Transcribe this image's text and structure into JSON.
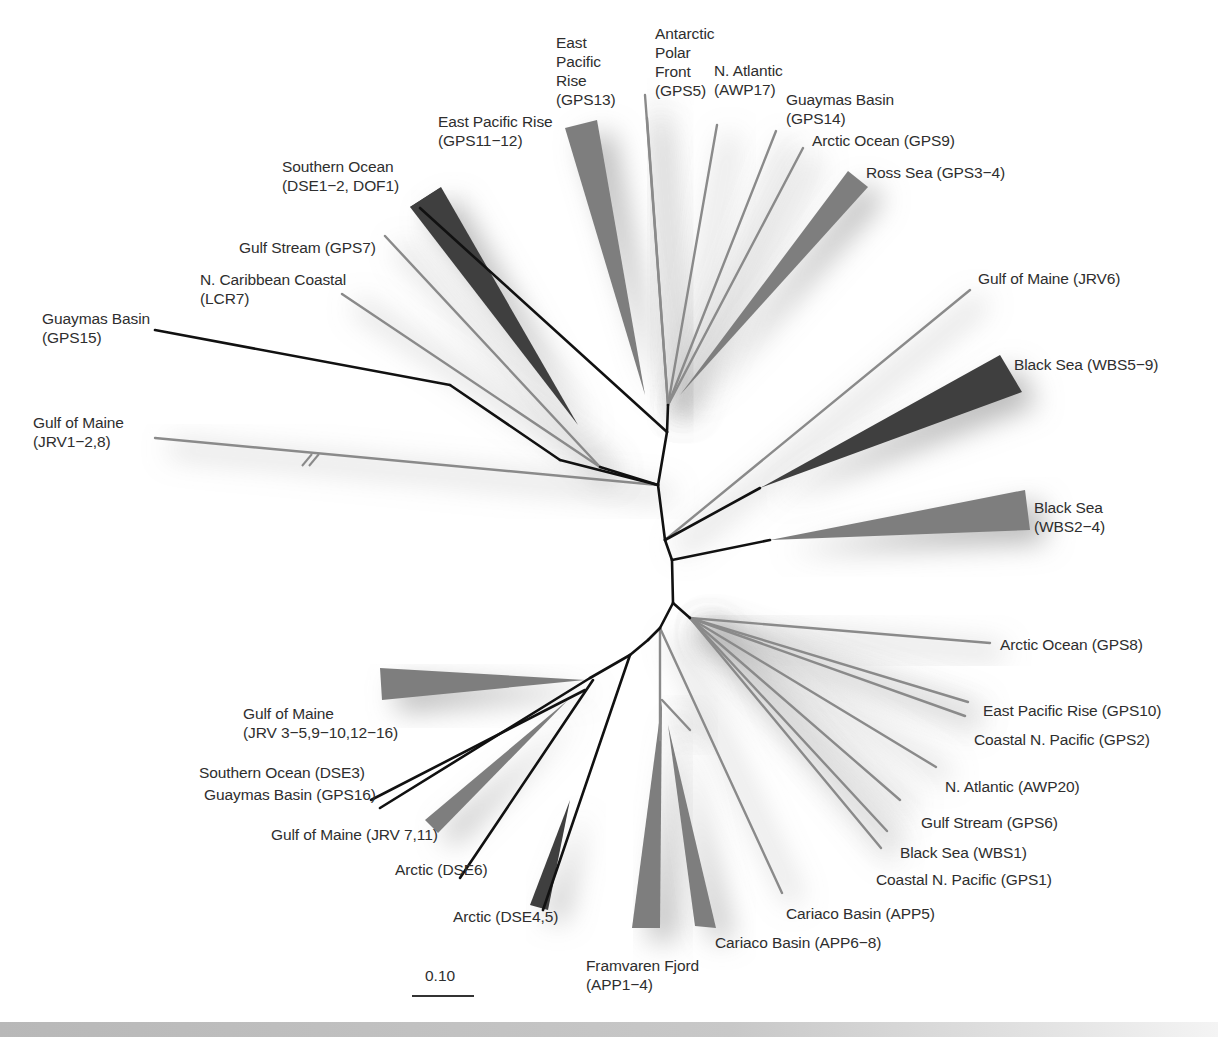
{
  "figure": {
    "type": "unrooted phylogenetic tree",
    "scale_bar": {
      "label": "0.10",
      "length_px": 62
    }
  },
  "colors": {
    "backbone": "#111111",
    "leaf_branch": "#8a8a8a",
    "clade_light": "#7e7e7e",
    "clade_dark": "#3f3f3f",
    "label_text": "#2e2e2e",
    "shadow": "#9a9a9a"
  },
  "labels": [
    {
      "id": "l1",
      "text": "East\nPacific\nRise\n(GPS13)",
      "x": 556,
      "y": 33
    },
    {
      "id": "l2",
      "text": "Antarctic\nPolar\nFront\n(GPS5)",
      "x": 655,
      "y": 24
    },
    {
      "id": "l3",
      "text": "N. Atlantic\n(AWP17)",
      "x": 714,
      "y": 61
    },
    {
      "id": "l4",
      "text": "Guaymas Basin\n(GPS14)",
      "x": 786,
      "y": 90
    },
    {
      "id": "l5",
      "text": "Arctic Ocean (GPS9)",
      "x": 812,
      "y": 131
    },
    {
      "id": "l6",
      "text": "East Pacific Rise\n(GPS11−12)",
      "x": 438,
      "y": 112
    },
    {
      "id": "l7",
      "text": "Ross Sea (GPS3−4)",
      "x": 866,
      "y": 163
    },
    {
      "id": "l8",
      "text": "Southern Ocean\n(DSE1−2, DOF1)",
      "x": 282,
      "y": 157
    },
    {
      "id": "l9",
      "text": "Gulf Stream (GPS7)",
      "x": 239,
      "y": 238
    },
    {
      "id": "l10",
      "text": "N. Caribbean Coastal\n(LCR7)",
      "x": 200,
      "y": 270
    },
    {
      "id": "l11",
      "text": "Gulf of Maine (JRV6)",
      "x": 978,
      "y": 269
    },
    {
      "id": "l12",
      "text": "Guaymas Basin\n(GPS15)",
      "x": 42,
      "y": 309
    },
    {
      "id": "l13",
      "text": "Black Sea (WBS5−9)",
      "x": 1014,
      "y": 355
    },
    {
      "id": "l14",
      "text": "Gulf of Maine\n(JRV1−2,8)",
      "x": 33,
      "y": 413
    },
    {
      "id": "l15",
      "text": "Black Sea\n(WBS2−4)",
      "x": 1034,
      "y": 498
    },
    {
      "id": "l16",
      "text": "Arctic Ocean (GPS8)",
      "x": 1000,
      "y": 635
    },
    {
      "id": "l17",
      "text": "East Pacific Rise (GPS10)",
      "x": 983,
      "y": 701
    },
    {
      "id": "l18",
      "text": "Coastal N. Pacific (GPS2)",
      "x": 974,
      "y": 730
    },
    {
      "id": "l19",
      "text": "Gulf of Maine\n(JRV 3−5,9−10,12−16)",
      "x": 243,
      "y": 704
    },
    {
      "id": "l20",
      "text": "Southern Ocean (DSE3)",
      "x": 199,
      "y": 763
    },
    {
      "id": "l21",
      "text": "Guaymas Basin (GPS16)",
      "x": 204,
      "y": 785
    },
    {
      "id": "l22",
      "text": "N. Atlantic (AWP20)",
      "x": 945,
      "y": 777
    },
    {
      "id": "l23",
      "text": "Gulf of Maine (JRV 7,11)",
      "x": 271,
      "y": 825
    },
    {
      "id": "l24",
      "text": "Gulf Stream (GPS6)",
      "x": 921,
      "y": 813
    },
    {
      "id": "l25",
      "text": "Black Sea (WBS1)",
      "x": 900,
      "y": 843
    },
    {
      "id": "l26",
      "text": "Arctic (DSE6)",
      "x": 395,
      "y": 860
    },
    {
      "id": "l27",
      "text": "Coastal N. Pacific (GPS1)",
      "x": 876,
      "y": 870
    },
    {
      "id": "l28",
      "text": "Arctic (DSE4,5)",
      "x": 453,
      "y": 907
    },
    {
      "id": "l29",
      "text": "Cariaco Basin (APP5)",
      "x": 786,
      "y": 904
    },
    {
      "id": "l30",
      "text": "Cariaco Basin (APP6−8)",
      "x": 715,
      "y": 933
    },
    {
      "id": "l31",
      "text": "Framvaren Fjord\n(APP1−4)",
      "x": 586,
      "y": 956
    }
  ],
  "backbone": [
    [
      [
        658,
        485
      ],
      [
        667,
        432
      ]
    ],
    [
      [
        667,
        432
      ],
      [
        668,
        405
      ]
    ],
    [
      [
        658,
        485
      ],
      [
        665,
        540
      ]
    ],
    [
      [
        665,
        540
      ],
      [
        672,
        560
      ]
    ],
    [
      [
        672,
        560
      ],
      [
        673,
        603
      ]
    ],
    [
      [
        673,
        603
      ],
      [
        660,
        628
      ]
    ],
    [
      [
        673,
        603
      ],
      [
        690,
        618
      ]
    ],
    [
      [
        660,
        628
      ],
      [
        648,
        640
      ]
    ],
    [
      [
        648,
        640
      ],
      [
        630,
        655
      ]
    ],
    [
      [
        630,
        655
      ],
      [
        590,
        678
      ]
    ],
    [
      [
        658,
        485
      ],
      [
        560,
        460
      ]
    ],
    [
      [
        560,
        460
      ],
      [
        450,
        385
      ]
    ],
    [
      [
        450,
        385
      ],
      [
        155,
        330
      ]
    ],
    [
      [
        658,
        485
      ],
      [
        600,
        467
      ]
    ],
    [
      [
        667,
        432
      ],
      [
        420,
        208
      ]
    ],
    [
      [
        665,
        540
      ],
      [
        760,
        488
      ]
    ],
    [
      [
        672,
        560
      ],
      [
        770,
        540
      ]
    ],
    [
      [
        630,
        655
      ],
      [
        543,
        910
      ]
    ],
    [
      [
        590,
        678
      ],
      [
        380,
        808
      ]
    ],
    [
      [
        585,
        690
      ],
      [
        371,
        800
      ]
    ],
    [
      [
        593,
        680
      ],
      [
        460,
        878
      ]
    ]
  ],
  "leaf_branches": [
    [
      [
        668,
        405
      ],
      [
        645,
        95
      ]
    ],
    [
      [
        668,
        405
      ],
      [
        647,
        118
      ]
    ],
    [
      [
        668,
        405
      ],
      [
        717,
        125
      ]
    ],
    [
      [
        668,
        405
      ],
      [
        776,
        131
      ]
    ],
    [
      [
        668,
        405
      ],
      [
        803,
        148
      ]
    ],
    [
      [
        600,
        467
      ],
      [
        385,
        236
      ]
    ],
    [
      [
        600,
        467
      ],
      [
        342,
        294
      ]
    ],
    [
      [
        658,
        485
      ],
      [
        155,
        438
      ]
    ],
    [
      [
        665,
        540
      ],
      [
        970,
        290
      ]
    ],
    [
      [
        690,
        618
      ],
      [
        990,
        643
      ]
    ],
    [
      [
        690,
        618
      ],
      [
        968,
        702
      ]
    ],
    [
      [
        690,
        618
      ],
      [
        965,
        716
      ]
    ],
    [
      [
        690,
        618
      ],
      [
        936,
        767
      ]
    ],
    [
      [
        690,
        618
      ],
      [
        900,
        800
      ]
    ],
    [
      [
        690,
        618
      ],
      [
        887,
        831
      ]
    ],
    [
      [
        690,
        618
      ],
      [
        881,
        848
      ]
    ],
    [
      [
        660,
        628
      ],
      [
        782,
        893
      ]
    ],
    [
      [
        660,
        628
      ],
      [
        660,
        740
      ]
    ],
    [
      [
        662,
        700
      ],
      [
        690,
        730
      ]
    ]
  ],
  "clades": [
    {
      "name": "east-pacific-rise-gps11-12",
      "shade": "light",
      "points": [
        [
          645,
          395
        ],
        [
          565,
          128
        ],
        [
          597,
          120
        ]
      ]
    },
    {
      "name": "ross-sea-gps3-4",
      "shade": "light",
      "points": [
        [
          680,
          395
        ],
        [
          848,
          171
        ],
        [
          868,
          187
        ]
      ]
    },
    {
      "name": "southern-ocean-dse1-2",
      "shade": "dark",
      "points": [
        [
          420,
          208
        ],
        [
          410,
          207
        ],
        [
          440,
          188
        ]
      ]
    },
    {
      "name": "southern-ocean-dse1-2-body",
      "shade": "dark",
      "points": [
        [
          578,
          425
        ],
        [
          410,
          207
        ],
        [
          441,
          187
        ]
      ]
    },
    {
      "name": "black-sea-wbs5-9",
      "shade": "dark",
      "points": [
        [
          760,
          488
        ],
        [
          1000,
          355
        ],
        [
          1022,
          392
        ]
      ]
    },
    {
      "name": "black-sea-wbs2-4",
      "shade": "light",
      "points": [
        [
          770,
          540
        ],
        [
          1025,
          490
        ],
        [
          1030,
          530
        ]
      ]
    },
    {
      "name": "gulf-of-maine-jrv3-16",
      "shade": "light",
      "points": [
        [
          585,
          680
        ],
        [
          380,
          668
        ],
        [
          382,
          700
        ]
      ]
    },
    {
      "name": "gulf-of-maine-jrv7-11",
      "shade": "light",
      "points": [
        [
          568,
          700
        ],
        [
          425,
          820
        ],
        [
          438,
          833
        ]
      ]
    },
    {
      "name": "arctic-dse4-5",
      "shade": "dark",
      "points": [
        [
          570,
          800
        ],
        [
          530,
          905
        ],
        [
          548,
          910
        ]
      ]
    },
    {
      "name": "framvaren-fjord-app1-4",
      "shade": "light",
      "points": [
        [
          662,
          700
        ],
        [
          632,
          928
        ],
        [
          660,
          928
        ]
      ]
    },
    {
      "name": "cariaco-basin-app6-8",
      "shade": "light",
      "points": [
        [
          668,
          725
        ],
        [
          695,
          926
        ],
        [
          716,
          928
        ]
      ]
    }
  ],
  "break_mark": {
    "x": 310,
    "y": 460
  }
}
